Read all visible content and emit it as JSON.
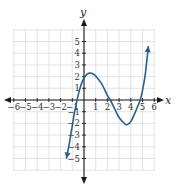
{
  "chart_data": {
    "type": "line",
    "title": "",
    "xlabel": "x",
    "ylabel": "y",
    "xlim": [
      -6,
      6
    ],
    "ylim": [
      -6,
      6
    ],
    "grid": true,
    "x_ticks": [
      -6,
      -5,
      -4,
      -3,
      -2,
      -1,
      1,
      2,
      3,
      4,
      5,
      6
    ],
    "y_ticks": [
      -5,
      -4,
      -3,
      -2,
      -1,
      1,
      2,
      3,
      4,
      5
    ],
    "curve_color": "#2a5f8a",
    "series": [
      {
        "name": "curve",
        "description": "Polynomial-looking curve traced from the image; arrows at both ends indicate the curve continues",
        "points": [
          [
            -1.5,
            -5.0
          ],
          [
            -1.2,
            -3.4
          ],
          [
            -1.0,
            -2.2
          ],
          [
            -0.8,
            -1.0
          ],
          [
            -0.5,
            0.4
          ],
          [
            -0.25,
            1.3
          ],
          [
            0.0,
            1.9
          ],
          [
            0.25,
            2.2
          ],
          [
            0.5,
            2.3
          ],
          [
            0.75,
            2.25
          ],
          [
            1.0,
            2.05
          ],
          [
            1.5,
            1.4
          ],
          [
            2.0,
            0.4
          ],
          [
            2.25,
            0.0
          ],
          [
            2.5,
            -0.5
          ],
          [
            3.0,
            -1.5
          ],
          [
            3.5,
            -2.05
          ],
          [
            3.7,
            -2.1
          ],
          [
            4.0,
            -1.85
          ],
          [
            4.4,
            -1.0
          ],
          [
            4.8,
            0.0
          ],
          [
            5.0,
            0.8
          ],
          [
            5.25,
            2.3
          ],
          [
            5.5,
            4.6
          ]
        ],
        "start_arrow": [
          -1.5,
          -5.0
        ],
        "end_arrow": [
          5.5,
          4.6
        ]
      }
    ],
    "approx_x_intercepts": [
      -0.8,
      2.25,
      4.8
    ],
    "approx_y_intercept": 1.9,
    "approx_local_max": [
      0.5,
      2.3
    ],
    "approx_local_min": [
      3.7,
      -2.1
    ],
    "legend": null
  },
  "labels": {
    "x_axis": "x",
    "y_axis": "y"
  }
}
